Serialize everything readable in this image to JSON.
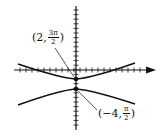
{
  "figure": {
    "axes": {
      "x_axis_y": 70,
      "y_axis_x": 76,
      "x_ticks": 20,
      "y_ticks": 26
    },
    "points": [
      {
        "label_prefix": "(2,",
        "frac_num": "3π",
        "frac_den": "2",
        "label_suffix": ")"
      },
      {
        "label_prefix": "(−4,",
        "frac_num": "π",
        "frac_den": "2",
        "label_suffix": ")"
      }
    ],
    "colors": {
      "stroke": "#111111",
      "background": "#ffffff"
    }
  }
}
